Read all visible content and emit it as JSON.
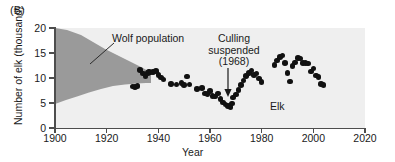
{
  "panel": {
    "label": "(B)"
  },
  "axes": {
    "xlabel": "Year",
    "ylabel": "Number of elk (thousand)",
    "xticks": [
      1900,
      1920,
      1940,
      1960,
      1980,
      2000,
      2020
    ],
    "yticks": [
      0,
      5,
      10,
      15,
      20
    ],
    "xlim": [
      1900,
      2020
    ],
    "ylim": [
      0,
      20
    ],
    "plot_bg": "#efefef",
    "axis_color": "#4d4d4d"
  },
  "annotations": {
    "wolf": "Wolf population",
    "culling_line1": "Culling",
    "culling_line2": "suspended",
    "culling_line3": "(1968)",
    "elk": "Elk"
  },
  "chart_data": {
    "type": "scatter",
    "title": "",
    "xlabel": "Year",
    "ylabel": "Number of elk (thousand)",
    "xlim": [
      1900,
      2020
    ],
    "ylim": [
      0,
      20
    ],
    "grid": false,
    "legend": null,
    "series": [
      {
        "name": "Elk",
        "marker": "filled-circle",
        "color": "#111111",
        "points": [
          [
            1930,
            8.3
          ],
          [
            1931,
            8.2
          ],
          [
            1932,
            8.4
          ],
          [
            1933,
            11.6
          ],
          [
            1934,
            10.9
          ],
          [
            1935,
            10.3
          ],
          [
            1936,
            11.0
          ],
          [
            1936.5,
            11.3
          ],
          [
            1937,
            11.1
          ],
          [
            1938,
            11.2
          ],
          [
            1939,
            11.4
          ],
          [
            1940,
            10.6
          ],
          [
            1941,
            10.1
          ],
          [
            1942,
            9.7
          ],
          [
            1945,
            8.8
          ],
          [
            1947,
            8.7
          ],
          [
            1949,
            9.0
          ],
          [
            1950,
            8.6
          ],
          [
            1951,
            10.3
          ],
          [
            1952,
            8.7
          ],
          [
            1955,
            7.8
          ],
          [
            1957,
            8.0
          ],
          [
            1958,
            6.9
          ],
          [
            1959,
            6.8
          ],
          [
            1960,
            7.4
          ],
          [
            1961,
            6.4
          ],
          [
            1962,
            6.3
          ],
          [
            1963,
            6.9
          ],
          [
            1964,
            5.8
          ],
          [
            1965,
            5.1
          ],
          [
            1966,
            4.7
          ],
          [
            1967,
            4.4
          ],
          [
            1968,
            4.2
          ],
          [
            1968.5,
            4.9
          ],
          [
            1969,
            6.1
          ],
          [
            1970,
            6.7
          ],
          [
            1971,
            7.6
          ],
          [
            1972,
            8.6
          ],
          [
            1973,
            9.5
          ],
          [
            1974,
            10.4
          ],
          [
            1975,
            11.0
          ],
          [
            1976,
            11.5
          ],
          [
            1977,
            10.6
          ],
          [
            1978,
            10.9
          ],
          [
            1979,
            9.9
          ],
          [
            1980,
            9.2
          ],
          [
            1985,
            12.6
          ],
          [
            1986,
            13.5
          ],
          [
            1987,
            14.2
          ],
          [
            1988,
            14.5
          ],
          [
            1989,
            13.0
          ],
          [
            1990,
            11.0
          ],
          [
            1991,
            9.3
          ],
          [
            1992,
            12.4
          ],
          [
            1993,
            13.1
          ],
          [
            1994,
            14.0
          ],
          [
            1995,
            13.9
          ],
          [
            1996,
            13.0
          ],
          [
            1997,
            13.0
          ],
          [
            1998,
            12.9
          ],
          [
            1999,
            11.3
          ],
          [
            2000,
            11.9
          ],
          [
            2001,
            10.5
          ],
          [
            2002,
            10.2
          ],
          [
            2003,
            8.8
          ],
          [
            2004,
            8.6
          ]
        ]
      },
      {
        "name": "Wolf population",
        "marker": "shaded-band",
        "color": "#9a9a9a",
        "upper_envelope": [
          [
            1900,
            20.0
          ],
          [
            1910,
            19.0
          ],
          [
            1920,
            15.5
          ],
          [
            1930,
            12.0
          ],
          [
            1935,
            10.0
          ],
          [
            1940,
            9.0
          ]
        ],
        "lower_envelope": [
          [
            1900,
            4.8
          ],
          [
            1910,
            5.7
          ],
          [
            1920,
            6.9
          ],
          [
            1930,
            8.1
          ],
          [
            1935,
            8.6
          ],
          [
            1940,
            9.0
          ]
        ]
      }
    ]
  }
}
